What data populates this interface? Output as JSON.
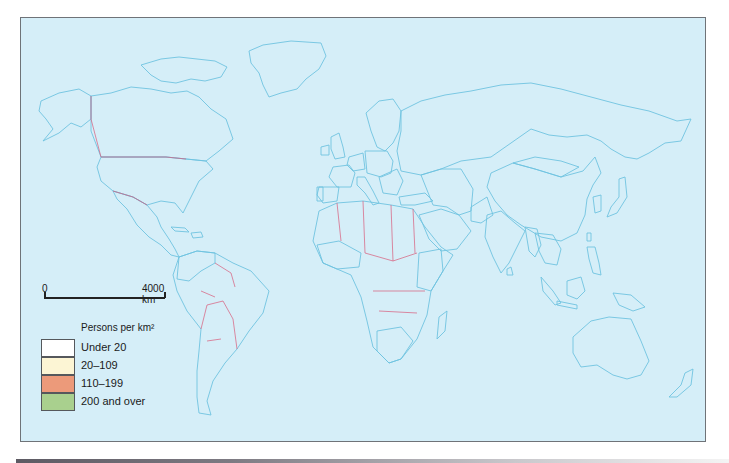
{
  "map": {
    "title": "World population density",
    "colors": {
      "sea": "#d5eef8",
      "under_20": "#ffffff",
      "20_109": "#fcf5d4",
      "110_199": "#ec9a7a",
      "200_and_over": "#a9d08e",
      "coastline": "#6fc3e0",
      "borders": "#d85a7a"
    },
    "regions": {
      "under_20": [
        "Canada",
        "Greenland",
        "Russia",
        "Mongolia",
        "Australia",
        "Brazil",
        "Argentina",
        "Saudi Arabia",
        "Algeria",
        "Libya",
        "Sahara countries"
      ],
      "20_109": [
        "United States",
        "Alaska",
        "Mexico",
        "Central America",
        "Colombia",
        "Venezuela",
        "Scandinavia",
        "France",
        "Spain",
        "Eastern Europe",
        "Turkey",
        "Middle East",
        "West Africa",
        "East Africa",
        "South Africa",
        "Indonesia (Borneo)",
        "Myanmar",
        "Afghanistan"
      ],
      "110_199": [
        "Poland",
        "Czechoslovakia",
        "Hungary",
        "Italy",
        "Portugal",
        "Hispaniola",
        "China",
        "Pakistan",
        "Thailand",
        "Vietnam",
        "Sri Lanka",
        "Java"
      ],
      "200_and_over": [
        "United Kingdom",
        "Netherlands",
        "Belgium",
        "West Germany",
        "India",
        "Bangladesh",
        "Japan",
        "South Korea",
        "Philippines",
        "Taiwan"
      ]
    }
  },
  "scale": {
    "start_label": "0",
    "end_label": "4000 km"
  },
  "legend": {
    "title": "Persons per km²",
    "items": [
      {
        "label": "Under 20",
        "color": "#ffffff"
      },
      {
        "label": "20–109",
        "color": "#fcf5d4"
      },
      {
        "label": "110–199",
        "color": "#ec9a7a"
      },
      {
        "label": "200 and over",
        "color": "#a9d08e"
      }
    ]
  }
}
